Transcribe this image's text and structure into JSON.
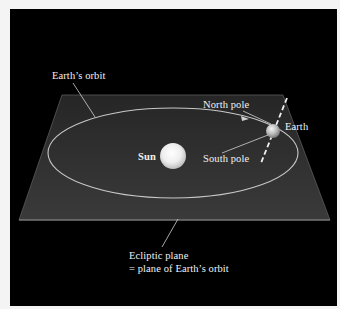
{
  "figure": {
    "background_color": "#000000",
    "page_color": "#f4f4f4",
    "plane_color": "#2e2e2e",
    "orbit_color": "#c8c8c8",
    "label_color": "#f2f2f2"
  },
  "labels": {
    "earths_orbit": "Earth’s orbit",
    "north_pole": "North pole",
    "earth": "Earth",
    "sun": "Sun",
    "south_pole": "South pole",
    "ecliptic_line1": "Ecliptic plane",
    "ecliptic_line2": "= plane of Earth’s orbit"
  },
  "icons": {
    "sun": "sun-sphere",
    "earth": "earth-sphere",
    "axis": "rotation-axis-dashed",
    "orbit_arrow": "direction-arrow"
  }
}
